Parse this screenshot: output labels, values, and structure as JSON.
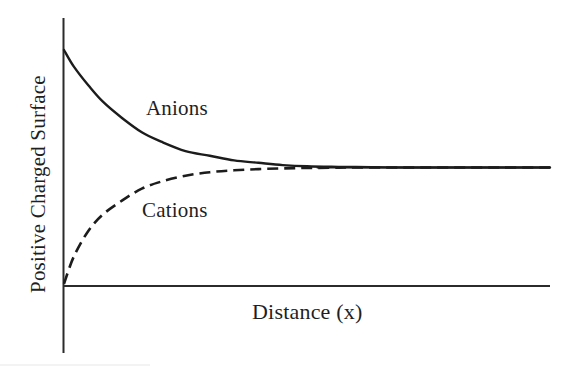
{
  "figure": {
    "background_color": "#ffffff",
    "line_color": "#1c1c1c",
    "axis_color": "#2b2b2b"
  },
  "labels": {
    "anions": "Anions",
    "cations": "Cations",
    "x_axis": "Distance (x)",
    "y_axis": "Positive Charged Surface"
  },
  "chart_data": {
    "type": "line",
    "title": "",
    "subtitle": "",
    "xlabel": "Distance (x)",
    "ylabel": "Positive Charged Surface",
    "xlim": [
      0,
      100
    ],
    "ylim": [
      0,
      100
    ],
    "grid": false,
    "legend": "inline-annotations",
    "axis_ticks": {
      "x": [],
      "y": []
    },
    "bulk_value": 50,
    "series": [
      {
        "name": "Anions",
        "style": "solid",
        "color": "#1c1c1c",
        "x": [
          0,
          2,
          5,
          8,
          12,
          16,
          20,
          25,
          30,
          35,
          40,
          45,
          50,
          55,
          60,
          70,
          80,
          90,
          100
        ],
        "y": [
          100,
          93,
          85,
          78,
          71,
          65,
          61,
          57,
          55,
          53,
          52,
          51,
          50.5,
          50.3,
          50.2,
          50,
          50,
          50,
          50
        ]
      },
      {
        "name": "Cations",
        "style": "dashed",
        "color": "#1c1c1c",
        "x": [
          0,
          2,
          5,
          8,
          12,
          16,
          20,
          25,
          30,
          35,
          40,
          45,
          50,
          55,
          60,
          70,
          80,
          90,
          100
        ],
        "y": [
          0.5,
          12,
          23,
          30,
          36,
          41,
          44,
          46.5,
          48,
          48.8,
          49.3,
          49.6,
          49.8,
          49.9,
          50,
          50,
          50,
          50,
          50
        ]
      }
    ],
    "annotations": [
      {
        "text": "Anions",
        "x": 18,
        "y": 72
      },
      {
        "text": "Cations",
        "x": 17,
        "y": 40
      }
    ]
  }
}
